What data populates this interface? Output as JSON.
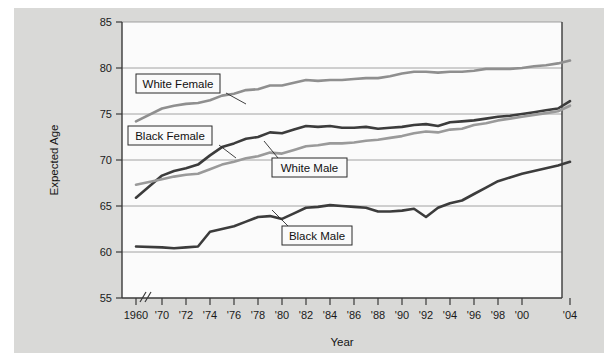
{
  "figure": {
    "background_color": "#d9d9d7",
    "plot_background_color": "#fbfbfb"
  },
  "axes": {
    "y_title": "Expected Age",
    "x_title": "Year",
    "y_ticks": [
      "55",
      "60",
      "65",
      "70",
      "75",
      "80",
      "85"
    ],
    "x_ticks": [
      "1960",
      "'70",
      "'72",
      "'74",
      "'76",
      "'78",
      "'80",
      "'82",
      "'84",
      "'86",
      "'88",
      "'90",
      "'92",
      "'94",
      "'96",
      "'98",
      "'00",
      "'04"
    ],
    "axis_break_marker": "//"
  },
  "callouts": [
    {
      "label": "White Female"
    },
    {
      "label": "Black Female"
    },
    {
      "label": "White Male"
    },
    {
      "label": "Black Male"
    }
  ],
  "chart_data": {
    "type": "line",
    "title": "",
    "xlabel": "Year",
    "ylabel": "Expected Age",
    "ylim": [
      55,
      85
    ],
    "grid": true,
    "legend_position": "inline-callouts",
    "x_tick_labels": [
      "1960",
      "'70",
      "'72",
      "'74",
      "'76",
      "'78",
      "'80",
      "'82",
      "'84",
      "'86",
      "'88",
      "'90",
      "'92",
      "'94",
      "'96",
      "'98",
      "'00",
      "'04"
    ],
    "x": [
      1960,
      1970,
      1971,
      1972,
      1973,
      1974,
      1975,
      1976,
      1977,
      1978,
      1979,
      1980,
      1981,
      1982,
      1983,
      1984,
      1985,
      1986,
      1987,
      1988,
      1989,
      1990,
      1991,
      1992,
      1993,
      1994,
      1995,
      1996,
      1997,
      1998,
      1999,
      2000,
      2001,
      2002,
      2003,
      2004
    ],
    "series": [
      {
        "name": "White Female",
        "color": "#8f8f8f",
        "values": [
          74.2,
          75.6,
          75.9,
          76.1,
          76.2,
          76.5,
          77.0,
          77.2,
          77.6,
          77.7,
          78.1,
          78.1,
          78.4,
          78.7,
          78.6,
          78.7,
          78.7,
          78.8,
          78.9,
          78.9,
          79.1,
          79.4,
          79.6,
          79.6,
          79.5,
          79.6,
          79.6,
          79.7,
          79.9,
          79.9,
          79.9,
          80.0,
          80.2,
          80.3,
          80.5,
          80.8
        ]
      },
      {
        "name": "Black Female",
        "color": "#3c3c3c",
        "values": [
          65.9,
          68.3,
          68.8,
          69.1,
          69.5,
          70.5,
          71.4,
          71.8,
          72.3,
          72.5,
          73.0,
          72.9,
          73.3,
          73.7,
          73.6,
          73.7,
          73.5,
          73.5,
          73.6,
          73.4,
          73.5,
          73.6,
          73.8,
          73.9,
          73.7,
          74.1,
          74.2,
          74.3,
          74.5,
          74.7,
          74.8,
          75.0,
          75.2,
          75.4,
          75.6,
          76.4
        ]
      },
      {
        "name": "White Male",
        "color": "#9a9a9a",
        "values": [
          67.3,
          67.9,
          68.2,
          68.4,
          68.5,
          69.0,
          69.5,
          69.8,
          70.2,
          70.4,
          70.8,
          70.7,
          71.1,
          71.5,
          71.6,
          71.8,
          71.8,
          71.9,
          72.1,
          72.2,
          72.4,
          72.6,
          72.9,
          73.1,
          73.0,
          73.3,
          73.4,
          73.8,
          74.0,
          74.3,
          74.5,
          74.7,
          74.9,
          75.1,
          75.3,
          75.9
        ]
      },
      {
        "name": "Black Male",
        "color": "#3c3c3c",
        "values": [
          60.6,
          60.5,
          60.4,
          60.5,
          60.6,
          62.2,
          62.5,
          62.8,
          63.3,
          63.8,
          63.9,
          63.6,
          64.2,
          64.8,
          64.9,
          65.1,
          65.0,
          64.9,
          64.8,
          64.4,
          64.4,
          64.5,
          64.7,
          63.8,
          64.8,
          65.3,
          65.6,
          66.3,
          67.0,
          67.7,
          68.1,
          68.5,
          68.8,
          69.1,
          69.4,
          69.8
        ]
      }
    ]
  }
}
